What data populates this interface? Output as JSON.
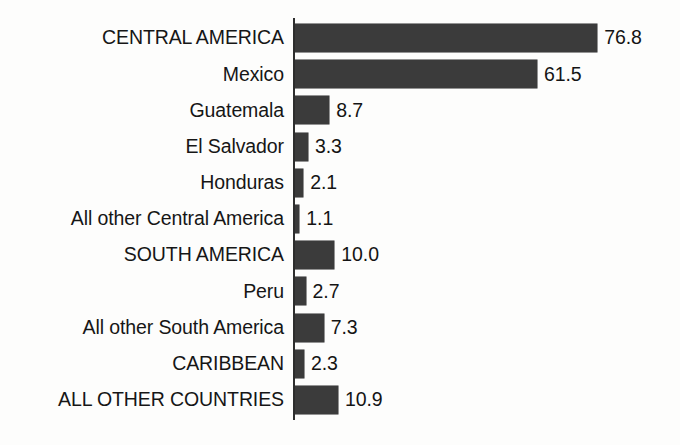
{
  "chart_data": {
    "type": "bar",
    "orientation": "horizontal",
    "title": "",
    "subtitle": "",
    "xlabel": "",
    "ylabel": "",
    "grid": false,
    "legend": false,
    "axis_line": true,
    "xlim": [
      0,
      80
    ],
    "bar_color": "#3b3b3b",
    "text_color": "#141414",
    "background_color": "#fdfdfc",
    "categories": [
      "CENTRAL AMERICA",
      "Mexico",
      "Guatemala",
      "El Salvador",
      "Honduras",
      "All other Central America",
      "SOUTH AMERICA",
      "Peru",
      "All other South America",
      "CARIBBEAN",
      "ALL OTHER COUNTRIES"
    ],
    "values": [
      76.8,
      61.5,
      8.7,
      3.3,
      2.1,
      1.1,
      10.0,
      2.7,
      7.3,
      2.3,
      10.9
    ],
    "value_labels": [
      "76.8",
      "61.5",
      "8.7",
      "3.3",
      "2.1",
      "1.1",
      "10.0",
      "2.7",
      "7.3",
      "2.3",
      "10.9"
    ],
    "rows": [
      {
        "label": "CENTRAL AMERICA",
        "value": 76.8,
        "value_label": "76.8",
        "emphasis": "heading"
      },
      {
        "label": "Mexico",
        "value": 61.5,
        "value_label": "61.5",
        "emphasis": "item"
      },
      {
        "label": "Guatemala",
        "value": 8.7,
        "value_label": "8.7",
        "emphasis": "item"
      },
      {
        "label": "El Salvador",
        "value": 3.3,
        "value_label": "3.3",
        "emphasis": "item"
      },
      {
        "label": "Honduras",
        "value": 2.1,
        "value_label": "2.1",
        "emphasis": "item"
      },
      {
        "label": "All other Central America",
        "value": 1.1,
        "value_label": "1.1",
        "emphasis": "item"
      },
      {
        "label": "SOUTH AMERICA",
        "value": 10.0,
        "value_label": "10.0",
        "emphasis": "heading"
      },
      {
        "label": "Peru",
        "value": 2.7,
        "value_label": "2.7",
        "emphasis": "item"
      },
      {
        "label": "All other South America",
        "value": 7.3,
        "value_label": "7.3",
        "emphasis": "item"
      },
      {
        "label": "CARIBBEAN",
        "value": 2.3,
        "value_label": "2.3",
        "emphasis": "heading"
      },
      {
        "label": "ALL OTHER COUNTRIES",
        "value": 10.9,
        "value_label": "10.9",
        "emphasis": "heading"
      }
    ]
  },
  "layout": {
    "px_per_unit": 3.935,
    "bar_height_px": 28,
    "row_height_px": 36.2
  }
}
